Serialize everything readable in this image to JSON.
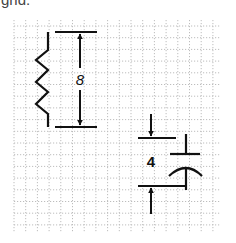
{
  "caption": {
    "fragment": "grid."
  },
  "grid": {
    "x_start": 14,
    "x_end": 220,
    "y_start": 20,
    "y_end": 232,
    "spacing": 11.7,
    "line_color": "#b8b8b8",
    "style": "dotted"
  },
  "resistor": {
    "label": "resistor",
    "dimension_label": "8",
    "lead_x": 48,
    "top_y": 32,
    "bottom_y": 127
  },
  "capacitor": {
    "label": "capacitor",
    "dimension_label": "4"
  },
  "colors": {
    "ink": "#111111",
    "grid": "#b8b8b8",
    "caption": "#444444"
  }
}
